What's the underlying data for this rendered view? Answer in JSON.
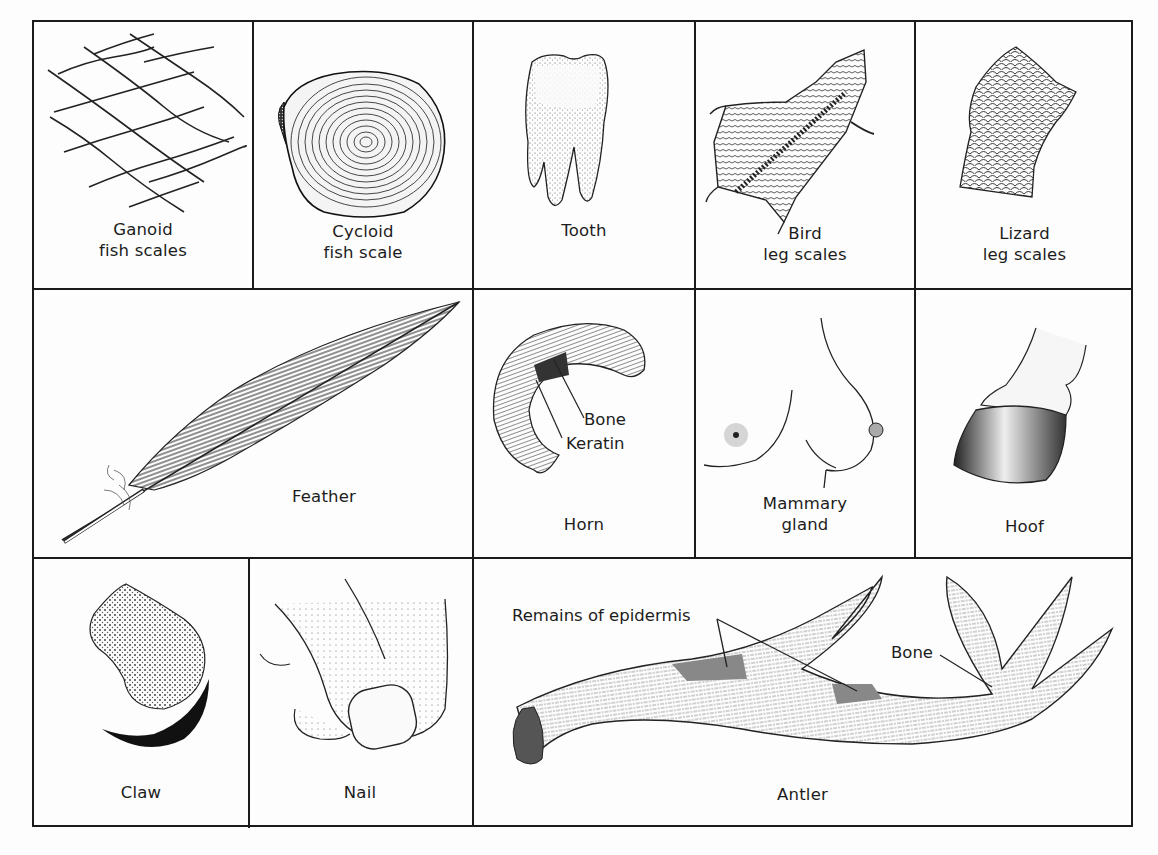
{
  "figure": {
    "panels": [
      {
        "id": "ganoid",
        "label_lines": [
          "Ganoid",
          "fish scales"
        ]
      },
      {
        "id": "cycloid",
        "label_lines": [
          "Cycloid",
          "fish scale"
        ]
      },
      {
        "id": "tooth",
        "label_lines": [
          "Tooth"
        ]
      },
      {
        "id": "bird",
        "label_lines": [
          "Bird",
          "leg scales"
        ]
      },
      {
        "id": "lizard",
        "label_lines": [
          "Lizard",
          "leg scales"
        ]
      },
      {
        "id": "feather",
        "label_lines": [
          "Feather"
        ]
      },
      {
        "id": "horn",
        "label_lines": [
          "Horn"
        ],
        "callouts": [
          "Bone",
          "Keratin"
        ]
      },
      {
        "id": "mammary",
        "label_lines": [
          "Mammary",
          "gland"
        ]
      },
      {
        "id": "hoof",
        "label_lines": [
          "Hoof"
        ]
      },
      {
        "id": "claw",
        "label_lines": [
          "Claw"
        ]
      },
      {
        "id": "nail",
        "label_lines": [
          "Nail"
        ]
      },
      {
        "id": "antler",
        "label_lines": [
          "Antler"
        ],
        "callouts": [
          "Remains of epidermis",
          "Bone"
        ]
      }
    ]
  }
}
